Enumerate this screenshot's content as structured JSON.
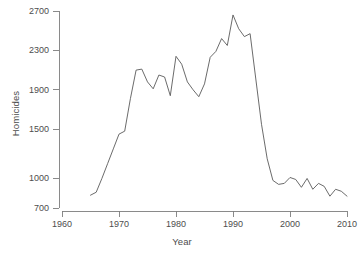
{
  "chart_data": {
    "type": "line",
    "title": "",
    "xlabel": "Year",
    "ylabel": "Homicides",
    "xlim": [
      1960,
      2012
    ],
    "ylim": [
      700,
      2700
    ],
    "grid": false,
    "legend": null,
    "xticks": [
      1960,
      1970,
      1980,
      1990,
      2000,
      2010
    ],
    "yticks": [
      700,
      1000,
      1500,
      1900,
      2300,
      2700
    ],
    "series": [
      {
        "name": "Homicides",
        "color": "#5a5a5a",
        "x": [
          1965,
          1966,
          1967,
          1968,
          1969,
          1970,
          1971,
          1972,
          1973,
          1974,
          1975,
          1976,
          1977,
          1978,
          1979,
          1980,
          1981,
          1982,
          1983,
          1984,
          1985,
          1986,
          1987,
          1988,
          1989,
          1990,
          1991,
          1992,
          1993,
          1994,
          1995,
          1996,
          1997,
          1998,
          1999,
          2000,
          2001,
          2002,
          2003,
          2004,
          2005,
          2006,
          2007,
          2008,
          2009,
          2010
        ],
        "y": [
          830,
          860,
          1000,
          1150,
          1300,
          1450,
          1480,
          1810,
          2100,
          2110,
          1980,
          1910,
          2050,
          2030,
          1840,
          2240,
          2160,
          1980,
          1900,
          1830,
          1960,
          2230,
          2290,
          2420,
          2350,
          2660,
          2520,
          2440,
          2470,
          2010,
          1550,
          1200,
          980,
          940,
          950,
          1010,
          990,
          910,
          1000,
          890,
          950,
          920,
          820,
          890,
          870,
          820
        ]
      }
    ]
  },
  "axes": {
    "y_axis_name": "homicides-axis",
    "x_axis_name": "year-axis"
  }
}
